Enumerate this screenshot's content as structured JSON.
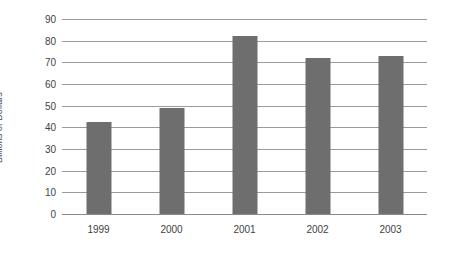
{
  "chart_data": {
    "type": "bar",
    "title": "",
    "xlabel": "",
    "ylabel": "Billions of Dollars",
    "categories": [
      "1999",
      "2000",
      "2001",
      "2002",
      "2003"
    ],
    "values": [
      42.5,
      49,
      82,
      72,
      73
    ],
    "series": [
      {
        "name": "Billions of Dollars",
        "values": [
          42.5,
          49,
          82,
          72,
          73
        ]
      }
    ],
    "ylim": [
      0,
      90
    ],
    "ytick_step": 10,
    "yticks": [
      "0",
      "10",
      "20",
      "30",
      "40",
      "50",
      "60",
      "70",
      "80",
      "90"
    ],
    "grid": "horizontal",
    "legend": "none",
    "bar_color": "#6e6e6e",
    "gridline_color": "#9a9a9a",
    "background_color": "#ffffff",
    "text_color": "#3f3f3f"
  }
}
